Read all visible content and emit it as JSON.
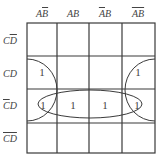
{
  "kmap": {
    "columns": [
      {
        "parts": [
          {
            "t": "A",
            "bar": false
          },
          {
            "t": "B",
            "bar": true
          }
        ]
      },
      {
        "parts": [
          {
            "t": "A",
            "bar": false
          },
          {
            "t": "B",
            "bar": false
          }
        ]
      },
      {
        "parts": [
          {
            "t": "A",
            "bar": true
          },
          {
            "t": "B",
            "bar": false
          }
        ]
      },
      {
        "parts": [
          {
            "t": "A",
            "bar": true
          },
          {
            "t": "B",
            "bar": true
          }
        ]
      }
    ],
    "column_labels": [
      "AB̄",
      "AB",
      "ĀB",
      "ĀB̄"
    ],
    "rows": [
      {
        "parts": [
          {
            "t": "C",
            "bar": false
          },
          {
            "t": "D",
            "bar": true
          }
        ]
      },
      {
        "parts": [
          {
            "t": "C",
            "bar": false
          },
          {
            "t": "D",
            "bar": false
          }
        ]
      },
      {
        "parts": [
          {
            "t": "C",
            "bar": true
          },
          {
            "t": "D",
            "bar": false
          }
        ]
      },
      {
        "parts": [
          {
            "t": "C",
            "bar": true
          },
          {
            "t": "D",
            "bar": true
          }
        ]
      }
    ],
    "row_labels": [
      "CD̄",
      "CD",
      "C̄D",
      "C̄D̄"
    ],
    "cells": [
      [
        "",
        "",
        "",
        ""
      ],
      [
        "1",
        "",
        "",
        "1"
      ],
      [
        "1",
        "1",
        "1",
        "1"
      ],
      [
        "",
        "",
        "",
        ""
      ]
    ],
    "groupings": [
      {
        "name": "row-CbarD",
        "shape": "ellipse",
        "covers": "row 3 all columns"
      },
      {
        "name": "wrap-left",
        "shape": "half-ellipse",
        "covers": "column 1, rows 2-3"
      },
      {
        "name": "wrap-right",
        "shape": "half-ellipse",
        "covers": "column 4, rows 2-3"
      }
    ],
    "line_color": "#3a3a3a"
  }
}
